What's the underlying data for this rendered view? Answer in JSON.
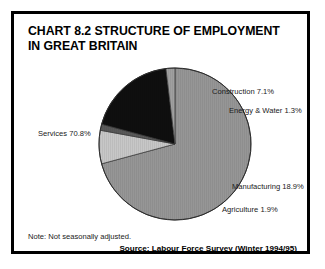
{
  "figure": {
    "title_line1": "CHART 8.2 STRUCTURE OF EMPLOYMENT",
    "title_line2": "IN GREAT BRITAIN",
    "note": "Note: Not seasonally adjusted.",
    "source": "Source: Labour Force Survey (Winter 1994/95)"
  },
  "labels": {
    "services": "Services 70.8%",
    "construction": "Construction 7.1%",
    "energy": "Energy & Water 1.3%",
    "manufacturing": "Manufacturing 18.9%",
    "agriculture": "Agriculture 1.9%"
  },
  "chart_data": {
    "type": "pie",
    "title": "CHART 8.2 STRUCTURE OF EMPLOYMENT IN GREAT BRITAIN",
    "xlabel": "",
    "ylabel": "",
    "unit": "percent",
    "total": 100.0,
    "start_angle_deg": 0,
    "direction": "clockwise",
    "legend": "none-labels-outside",
    "grid": false,
    "categories": [
      "Services",
      "Construction",
      "Energy & Water",
      "Manufacturing",
      "Agriculture"
    ],
    "values": [
      70.8,
      7.1,
      1.3,
      18.9,
      1.9
    ],
    "colors": [
      "#8f8f8f",
      "#c3c3c3",
      "#4f4f4f",
      "#000000",
      "#9a9a9a"
    ],
    "annotations": [
      "Note: Not seasonally adjusted.",
      "Source: Labour Force Survey (Winter 1994/95)"
    ],
    "slices": [
      {
        "label": "Services",
        "value": 70.8,
        "color": "#8f8f8f"
      },
      {
        "label": "Construction",
        "value": 7.1,
        "color": "#c3c3c3"
      },
      {
        "label": "Energy & Water",
        "value": 1.3,
        "color": "#4f4f4f"
      },
      {
        "label": "Manufacturing",
        "value": 18.9,
        "color": "#000000"
      },
      {
        "label": "Agriculture",
        "value": 1.9,
        "color": "#9a9a9a"
      }
    ]
  }
}
